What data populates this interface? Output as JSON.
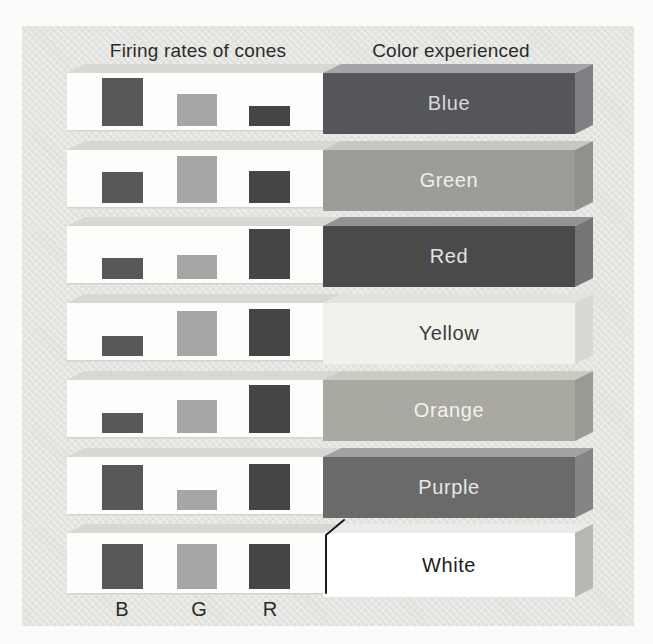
{
  "figure": {
    "header_left": "Firing rates of cones",
    "header_right": "Color experienced",
    "cone_labels": [
      "B",
      "G",
      "R"
    ],
    "rows": [
      {
        "label": "Blue",
        "firing": {
          "B": 96,
          "G": 64,
          "R": 40
        },
        "block": {
          "front": "#54565b",
          "top": "#a3a5a8",
          "side": "#7e8084",
          "label_color": "#d9d9db"
        },
        "callout": false
      },
      {
        "label": "Green",
        "firing": {
          "B": 62,
          "G": 94,
          "R": 64
        },
        "block": {
          "front": "#9c9c99",
          "top": "#c7c7c3",
          "side": "#90908d",
          "label_color": "#f0f0ec"
        },
        "callout": false
      },
      {
        "label": "Red",
        "firing": {
          "B": 42,
          "G": 48,
          "R": 100
        },
        "block": {
          "front": "#4a4a4a",
          "top": "#939393",
          "side": "#757575",
          "label_color": "#e3e3e1"
        },
        "callout": false
      },
      {
        "label": "Yellow",
        "firing": {
          "B": 40,
          "G": 90,
          "R": 94
        },
        "block": {
          "front": "#f2f2ed",
          "top": "#e3e3dd",
          "side": "#d9d9d3",
          "label_color": "#3c3c3a"
        },
        "callout": false
      },
      {
        "label": "Orange",
        "firing": {
          "B": 40,
          "G": 66,
          "R": 96
        },
        "block": {
          "front": "#a9a9a2",
          "top": "#cbcbc4",
          "side": "#9a9a93",
          "label_color": "#f2f2ee"
        },
        "callout": false
      },
      {
        "label": "Purple",
        "firing": {
          "B": 90,
          "G": 40,
          "R": 92
        },
        "block": {
          "front": "#6a6a6a",
          "top": "#a2a2a2",
          "side": "#858585",
          "label_color": "#e7e7e5"
        },
        "callout": false
      },
      {
        "label": "White",
        "firing": {
          "B": 90,
          "G": 90,
          "R": 90
        },
        "block": {
          "front": "#ffffff",
          "top": "#ebebe8",
          "side": "#b7b7b3",
          "label_color": "#1c1c1c"
        },
        "callout": true
      }
    ]
  },
  "chart_data": {
    "type": "bar",
    "categories": [
      "Blue",
      "Green",
      "Red",
      "Yellow",
      "Orange",
      "Purple",
      "White"
    ],
    "series": [
      {
        "name": "B cone",
        "values": [
          96,
          62,
          42,
          40,
          40,
          90,
          90
        ]
      },
      {
        "name": "G cone",
        "values": [
          64,
          94,
          48,
          90,
          66,
          40,
          90
        ]
      },
      {
        "name": "R cone",
        "values": [
          40,
          64,
          100,
          94,
          96,
          92,
          90
        ]
      }
    ],
    "xlabel": "Color experienced",
    "ylabel": "Relative firing rate (estimated, 0-100)",
    "ylim": [
      0,
      100
    ],
    "grid": false,
    "legend_position": "none"
  },
  "colors": {
    "page_bg": "#fbfbfa",
    "panel_bg": "#e4e4e1",
    "strip_front": "#fdfdfc",
    "strip_top": "#d7d7d3",
    "strip_shadow": "#d3d3cf",
    "bar_b": "#57585a",
    "bar_g": "#a6a6a4",
    "bar_r": "#454546",
    "heading_text": "#2b2b2b",
    "callout_line": "#1a1a1a"
  }
}
